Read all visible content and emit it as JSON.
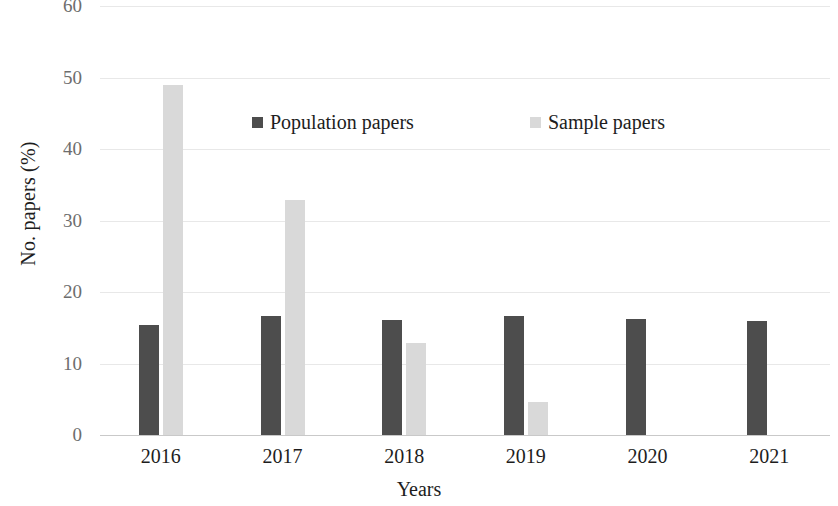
{
  "chart_data": {
    "type": "bar",
    "title": "",
    "xlabel": "Years",
    "ylabel": "No. papers (%)",
    "categories": [
      "2016",
      "2017",
      "2018",
      "2019",
      "2020",
      "2021"
    ],
    "series": [
      {
        "name": "Population papers",
        "color": "#4d4d4d",
        "values": [
          15.4,
          16.6,
          16.1,
          16.7,
          16.2,
          16.0
        ]
      },
      {
        "name": "Sample papers",
        "color": "#d9d9d9",
        "values": [
          49.0,
          32.8,
          12.8,
          4.6,
          0,
          0
        ]
      }
    ],
    "ylim": [
      0,
      60
    ],
    "yticks": [
      0,
      10,
      20,
      30,
      40,
      50,
      60
    ],
    "ytick_labels": [
      "0",
      "10",
      "20",
      "30",
      "40",
      "50",
      "60"
    ],
    "grid": true,
    "grid_color": "#e8e8e8",
    "legend_position": "upper-center",
    "legend": [
      {
        "label": "Population papers",
        "color": "#4d4d4d"
      },
      {
        "label": "Sample papers",
        "color": "#d9d9d9"
      }
    ],
    "axis_color": "#c9c9c9",
    "background": "#ffffff"
  }
}
